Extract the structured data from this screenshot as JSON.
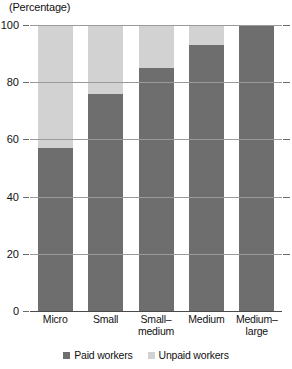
{
  "chart_data": {
    "type": "bar",
    "subtype": "stacked-bar-100",
    "title": "(Percentage)",
    "xlabel": "",
    "ylabel": "",
    "ylim": [
      0,
      100
    ],
    "yticks": [
      0,
      20,
      40,
      60,
      80,
      100
    ],
    "ytick_labels": [
      "0",
      "20",
      "40",
      "60",
      "80",
      "100"
    ],
    "grid": true,
    "legend_position": "bottom",
    "categories": [
      "Micro",
      "Small",
      "Small–medium",
      "Medium",
      "Medium–large"
    ],
    "series": [
      {
        "name": "Paid workers",
        "color": "#6e6e6e",
        "values": [
          57,
          76,
          85,
          93,
          100
        ]
      },
      {
        "name": "Unpaid workers",
        "color": "#d2d2d2",
        "values": [
          43,
          24,
          15,
          7,
          0
        ]
      }
    ]
  },
  "axis": {
    "title": "(Percentage)"
  },
  "legend": {
    "items": [
      {
        "label": "Paid workers",
        "color": "#6e6e6e",
        "swatch_name": "legend-swatch-paid"
      },
      {
        "label": "Unpaid workers",
        "color": "#d2d2d2",
        "swatch_name": "legend-swatch-unpaid"
      }
    ]
  }
}
